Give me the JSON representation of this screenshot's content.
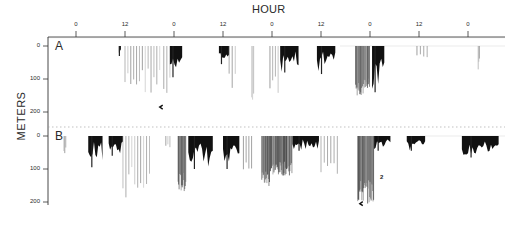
{
  "chart_data": {
    "type": "area",
    "title": "",
    "xlabel": "HOUR",
    "ylabel": "METERS",
    "x_ticks": [
      {
        "label": "0",
        "hour": 0
      },
      {
        "label": "12",
        "hour": 12
      },
      {
        "label": "0",
        "hour": 24
      },
      {
        "label": "12",
        "hour": 36
      },
      {
        "label": "0",
        "hour": 48
      },
      {
        "label": "12",
        "hour": 60
      },
      {
        "label": "0",
        "hour": 72
      },
      {
        "label": "12",
        "hour": 84
      },
      {
        "label": "0",
        "hour": 96
      }
    ],
    "xlim": [
      -7,
      106
    ],
    "y_ticks": [
      "0",
      "100",
      "200"
    ],
    "ylim": [
      0,
      200
    ],
    "y_inverted": true,
    "grid": false,
    "legend": null,
    "panels": [
      {
        "label": "A",
        "dive_bouts": [
          {
            "start_hour": 10.5,
            "end_hour": 11.0,
            "max_depth": 30,
            "style": "solid"
          },
          {
            "start_hour": 12.0,
            "end_hour": 20.5,
            "max_depth": 145,
            "style": "sparse"
          },
          {
            "start_hour": 21.5,
            "end_hour": 23.0,
            "max_depth": 195,
            "style": "sparse"
          },
          {
            "start_hour": 23.0,
            "end_hour": 26.0,
            "max_depth": 95,
            "style": "solid"
          },
          {
            "start_hour": 35.0,
            "end_hour": 37.5,
            "max_depth": 55,
            "style": "solid"
          },
          {
            "start_hour": 37.5,
            "end_hour": 39.0,
            "max_depth": 150,
            "style": "sparse"
          },
          {
            "start_hour": 43.0,
            "end_hour": 43.5,
            "max_depth": 170,
            "style": "sparse"
          },
          {
            "start_hour": 47.5,
            "end_hour": 49.5,
            "max_depth": 175,
            "style": "sparse"
          },
          {
            "start_hour": 50.0,
            "end_hour": 54.5,
            "max_depth": 80,
            "style": "solid"
          },
          {
            "start_hour": 59.0,
            "end_hour": 63.5,
            "max_depth": 85,
            "style": "solid"
          },
          {
            "start_hour": 68.5,
            "end_hour": 72.0,
            "max_depth": 150,
            "style": "dense"
          },
          {
            "start_hour": 72.5,
            "end_hour": 75.5,
            "max_depth": 140,
            "style": "solid"
          },
          {
            "start_hour": 83.5,
            "end_hour": 86.0,
            "max_depth": 40,
            "style": "sparse"
          },
          {
            "start_hour": 98.5,
            "end_hour": 98.8,
            "max_depth": 75,
            "style": "sparse"
          }
        ],
        "annotations": [
          {
            "text": "arrow",
            "hour": 20.5,
            "depth": 185
          }
        ]
      },
      {
        "label": "B",
        "dive_bouts": [
          {
            "start_hour": -3.0,
            "end_hour": -2.5,
            "max_depth": 70,
            "style": "sparse"
          },
          {
            "start_hour": 3.0,
            "end_hour": 6.5,
            "max_depth": 95,
            "style": "solid"
          },
          {
            "start_hour": 8.0,
            "end_hour": 11.5,
            "max_depth": 60,
            "style": "solid"
          },
          {
            "start_hour": 11.5,
            "end_hour": 18.0,
            "max_depth": 190,
            "style": "sparse"
          },
          {
            "start_hour": 22.0,
            "end_hour": 23.0,
            "max_depth": 40,
            "style": "sparse"
          },
          {
            "start_hour": 25.0,
            "end_hour": 27.0,
            "max_depth": 170,
            "style": "dense"
          },
          {
            "start_hour": 27.5,
            "end_hour": 33.5,
            "max_depth": 100,
            "style": "solid"
          },
          {
            "start_hour": 36.0,
            "end_hour": 40.0,
            "max_depth": 100,
            "style": "solid"
          },
          {
            "start_hour": 41.0,
            "end_hour": 43.0,
            "max_depth": 165,
            "style": "sparse"
          },
          {
            "start_hour": 45.5,
            "end_hour": 47.5,
            "max_depth": 155,
            "style": "dense"
          },
          {
            "start_hour": 47.5,
            "end_hour": 53.0,
            "max_depth": 120,
            "style": "dense"
          },
          {
            "start_hour": 53.0,
            "end_hour": 59.5,
            "max_depth": 45,
            "style": "solid"
          },
          {
            "start_hour": 60.0,
            "end_hour": 64.0,
            "max_depth": 165,
            "style": "sparse"
          },
          {
            "start_hour": 69.0,
            "end_hour": 73.0,
            "max_depth": 205,
            "style": "dense"
          },
          {
            "start_hour": 73.0,
            "end_hour": 77.0,
            "max_depth": 45,
            "style": "solid"
          },
          {
            "start_hour": 81.0,
            "end_hour": 85.5,
            "max_depth": 45,
            "style": "solid"
          },
          {
            "start_hour": 94.5,
            "end_hour": 103.5,
            "max_depth": 65,
            "style": "solid"
          }
        ],
        "annotations": [
          {
            "text": "2",
            "hour": 74.5,
            "depth": 120
          },
          {
            "text": "arrow",
            "hour": 69.5,
            "depth": 205
          }
        ]
      }
    ]
  },
  "labels": {
    "x_title": "HOUR",
    "y_title": "METERS",
    "panel_a": "A",
    "panel_b": "B",
    "annotation_2": "2"
  }
}
